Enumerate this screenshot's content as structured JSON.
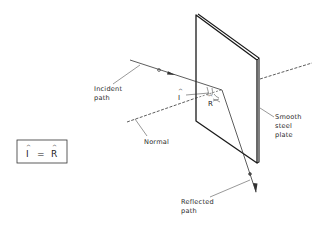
{
  "diagram": {
    "labels": {
      "incident": [
        "Incident",
        "path"
      ],
      "normal": "Normal",
      "plate": [
        "Smooth",
        "steel",
        "plate"
      ],
      "reflected": [
        "Reflected",
        "path"
      ],
      "angle_incidence": "I",
      "angle_reflection": "R",
      "hat": "^"
    },
    "equation_box": {
      "left": "I",
      "operator": "=",
      "right": "R",
      "hat": "^"
    },
    "colors": {
      "line": "#222222",
      "plate_edge": "#1a1a1a",
      "background": "#ffffff"
    }
  }
}
